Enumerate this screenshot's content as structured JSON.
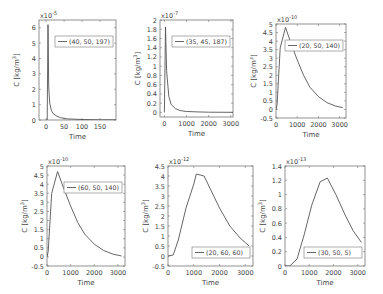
{
  "chart_data": [
    {
      "type": "line",
      "legend": "(40, 50, 197)",
      "legend_pos": "upper-right",
      "xlabel": "Time",
      "ylabel": "C [kg/m^3]",
      "exponent": "x10^-5",
      "xlim": [
        -20,
        195
      ],
      "ylim": [
        0,
        6.5
      ],
      "xticks": [
        0,
        50,
        100,
        150
      ],
      "yticks": [
        0,
        1,
        2,
        3,
        4,
        5,
        6
      ],
      "x": [
        0,
        3,
        5,
        7,
        10,
        15,
        20,
        30,
        40,
        60,
        100,
        150,
        195
      ],
      "y": [
        0,
        0,
        6.2,
        2.2,
        1.1,
        0.6,
        0.4,
        0.25,
        0.15,
        0.07,
        0.03,
        0.01,
        0.01
      ]
    },
    {
      "type": "line",
      "legend": "(35, 45, 187)",
      "legend_pos": "upper-right",
      "xlabel": "Time",
      "ylabel": "C [kg/m^3]",
      "exponent": "x10^-7",
      "xlim": [
        -200,
        3100
      ],
      "ylim": [
        -0.1,
        2.0
      ],
      "xticks": [
        0,
        1000,
        2000,
        3000
      ],
      "yticks": [
        0,
        0.2,
        0.4,
        0.6,
        0.8,
        1,
        1.2,
        1.4,
        1.6,
        1.8,
        2
      ],
      "x": [
        0,
        50,
        100,
        200,
        300,
        500,
        700,
        1000,
        1500,
        2000,
        3100
      ],
      "y": [
        0,
        1.85,
        0.9,
        0.35,
        0.17,
        0.08,
        0.04,
        0.02,
        0.01,
        0.005,
        0.002
      ]
    },
    {
      "type": "line",
      "legend": "(20, 50, 140)",
      "legend_pos": "upper-right",
      "xlabel": "Time",
      "ylabel": "C [kg/m^3]",
      "exponent": "x10^-10",
      "xlim": [
        0,
        3300
      ],
      "ylim": [
        -0.5,
        5
      ],
      "xticks": [
        0,
        1000,
        2000,
        3000
      ],
      "yticks": [
        -0.5,
        0,
        0.5,
        1,
        1.5,
        2,
        2.5,
        3,
        3.5,
        4,
        4.5,
        5
      ],
      "x": [
        0,
        50,
        200,
        450,
        700,
        1000,
        1300,
        1600,
        2000,
        2400,
        2800,
        3150
      ],
      "y": [
        0,
        0.3,
        3.6,
        4.8,
        3.9,
        2.9,
        2.0,
        1.3,
        0.75,
        0.4,
        0.2,
        0.1
      ]
    },
    {
      "type": "line",
      "legend": "(60, 50, 140)",
      "legend_pos": "upper-right",
      "xlabel": "Time",
      "ylabel": "C [kg/m^3]",
      "exponent": "x10^-10",
      "xlim": [
        0,
        3300
      ],
      "ylim": [
        -0.5,
        5
      ],
      "xticks": [
        0,
        1000,
        2000,
        3000
      ],
      "yticks": [
        -0.5,
        0,
        0.5,
        1,
        1.5,
        2,
        2.5,
        3,
        3.5,
        4,
        4.5,
        5
      ],
      "x": [
        0,
        50,
        200,
        450,
        700,
        1000,
        1300,
        1600,
        2000,
        2400,
        2800,
        3150
      ],
      "y": [
        0,
        0.3,
        3.5,
        4.7,
        3.8,
        2.8,
        1.9,
        1.25,
        0.7,
        0.35,
        0.15,
        0.05
      ]
    },
    {
      "type": "line",
      "legend": "(20, 60, 60)",
      "legend_pos": "lower-right",
      "xlabel": "Time",
      "ylabel": "C [kg/m^3]",
      "exponent": "x10^-12",
      "xlim": [
        0,
        3300
      ],
      "ylim": [
        -0.5,
        4.5
      ],
      "xticks": [
        0,
        1000,
        2000,
        3000
      ],
      "yticks": [
        -0.5,
        0,
        0.5,
        1,
        1.5,
        2,
        2.5,
        3,
        3.5,
        4,
        4.5
      ],
      "x": [
        0,
        200,
        400,
        700,
        1000,
        1100,
        1400,
        1700,
        2000,
        2400,
        2800,
        3150
      ],
      "y": [
        0,
        0.05,
        0.8,
        2.4,
        3.6,
        4.1,
        4.0,
        3.2,
        2.4,
        1.5,
        0.9,
        0.5
      ]
    },
    {
      "type": "line",
      "legend": "(30, 50, 5)",
      "legend_pos": "lower-right",
      "xlabel": "Time",
      "ylabel": "C [kg/m^3]",
      "exponent": "x10^-13",
      "xlim": [
        0,
        3300
      ],
      "ylim": [
        0,
        1.4
      ],
      "xticks": [
        0,
        1000,
        2000,
        3000
      ],
      "yticks": [
        0,
        0.2,
        0.4,
        0.6,
        0.8,
        1,
        1.2,
        1.4
      ],
      "x": [
        0,
        200,
        500,
        800,
        1100,
        1450,
        1750,
        2100,
        2500,
        2800,
        3150
      ],
      "y": [
        0,
        0,
        0.1,
        0.45,
        0.85,
        1.18,
        1.23,
        1.0,
        0.7,
        0.5,
        0.33
      ]
    }
  ],
  "panels": [
    {
      "left": 0,
      "top": 0,
      "box": [
        39,
        20,
        77,
        100
      ]
    },
    {
      "left": 122,
      "top": 0,
      "box": [
        38,
        20,
        73,
        97
      ]
    },
    {
      "left": 250,
      "top": 0,
      "box": [
        26,
        24,
        70,
        94
      ]
    },
    {
      "left": 0,
      "top": 148,
      "box": [
        47,
        18,
        78,
        100
      ]
    },
    {
      "left": 125,
      "top": 148,
      "box": [
        43,
        18,
        85,
        100
      ]
    },
    {
      "left": 250,
      "top": 148,
      "box": [
        35,
        18,
        80,
        100
      ]
    }
  ]
}
